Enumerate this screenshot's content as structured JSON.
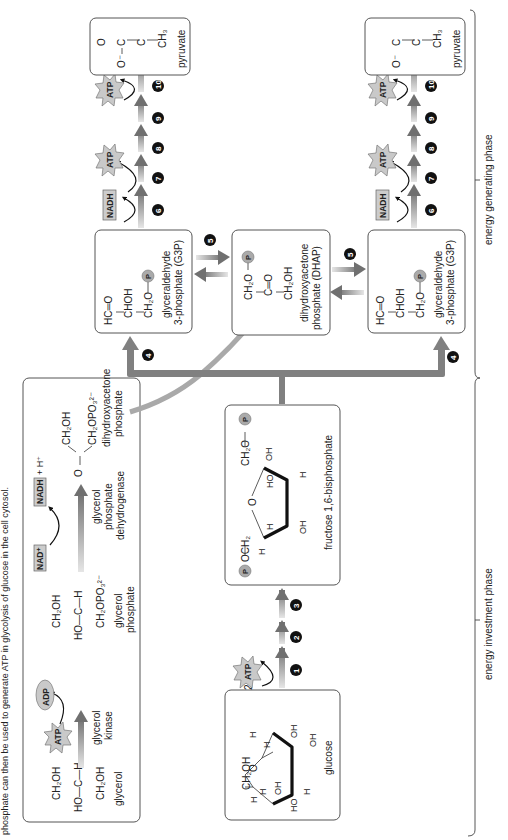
{
  "caption": "phosphate can then be used to generate ATP in glycolysis of glucose in the cell cytosol.",
  "glycerol_panel": {
    "glycerol": {
      "top": "CH₂OH",
      "mid": "HO—C—H",
      "bottom": "CH₂OH",
      "name": "glycerol"
    },
    "kinase_step": {
      "enzyme_line1": "glycerol",
      "enzyme_line2": "kinase",
      "cofactor_in": "ATP",
      "cofactor_out": "ADP"
    },
    "glycerol_phosphate": {
      "top": "CH₂OH",
      "mid": "HO—C—H",
      "bottom": "CH₂OPO₃²⁻",
      "name_line1": "glycerol",
      "name_line2": "phosphate"
    },
    "dehydrogenase_step": {
      "enzyme_line1": "glycerol",
      "enzyme_line2": "phosphate",
      "enzyme_line3": "dehydrogenase",
      "cofactor_in": "NAD⁺",
      "cofactor_out": "NADH",
      "extra": "+ H⁺"
    },
    "dhap": {
      "top": "CH₂OH",
      "carbonyl": "O",
      "bottom": "CH₂OPO₃²⁻",
      "name_line1": "dihydroxyacetone",
      "name_line2": "phosphate"
    }
  },
  "glucose": {
    "name": "glucose",
    "ch2oh": "CH₂OH",
    "ring_o": "O",
    "labels": [
      "H",
      "H",
      "OH",
      "H",
      "OH",
      "HO",
      "H",
      "OH",
      "H",
      "OH"
    ]
  },
  "investment_steps": {
    "coefficient": "2",
    "cofactor": "ATP",
    "steps": [
      "1",
      "2",
      "3"
    ]
  },
  "fructose": {
    "name": "fructose 1,6-bisphosphate",
    "left_group": "OCH₂",
    "right_group": "CH₂O",
    "ring_o": "O",
    "phosphate": "P",
    "labels": [
      "H",
      "H",
      "OH",
      "HO",
      "H",
      "OH"
    ]
  },
  "split": {
    "step": "4",
    "isomerase_step": "5"
  },
  "dhap_box": {
    "line1": "CH₂O",
    "line2": "C═O",
    "line3": "CH₂OH",
    "phosphate": "P",
    "name_line1": "dihydroxyacetone",
    "name_line2": "phosphate (DHAP)"
  },
  "g3p": {
    "line1": "HC═O",
    "line2": "CHOH",
    "line3": "CH₂O",
    "phosphate": "P",
    "name_line1": "glyceraldehyde",
    "name_line2": "3-phosphate (G3P)"
  },
  "generating_steps": {
    "nadh": "NADH",
    "atp": "ATP",
    "steps": [
      "6",
      "7",
      "8",
      "9",
      "10"
    ]
  },
  "pyruvate": {
    "o_minus": "O⁻",
    "c1": "C",
    "c2": "C",
    "ch3": "CH₃",
    "o1": "O",
    "o2": "O",
    "name": "pyruvate"
  },
  "phases": {
    "investment": "energy investment phase",
    "generating": "energy generating phase"
  },
  "colors": {
    "arrow_gray": "#808080",
    "box_border": "#555555",
    "cofactor_fill": "#cccccc",
    "step_circle": "#111111"
  }
}
